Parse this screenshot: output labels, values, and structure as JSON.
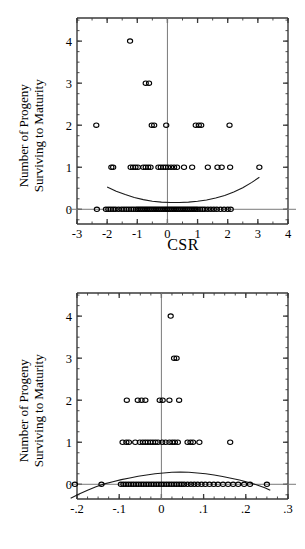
{
  "figure": {
    "panels": [
      {
        "id": "csr",
        "ylabel_line1": "Number of Progeny",
        "ylabel_line2": "Surviving to Maturity",
        "xlabel": "CSR"
      },
      {
        "id": "emr",
        "ylabel_line1": "Number of Progeny",
        "ylabel_line2": "Surviving to Maturity",
        "xlabel": "EMR"
      }
    ]
  },
  "chart_data": [
    {
      "type": "scatter",
      "id": "csr-scatter",
      "title": "",
      "xlabel": "CSR",
      "ylabel": "Number of Progeny Surviving to Maturity",
      "xlim": [
        -3,
        4
      ],
      "ylim": [
        -0.35,
        4.55
      ],
      "xticks": [
        -3,
        -2,
        -1,
        0,
        1,
        2,
        3,
        4
      ],
      "xticklabels": [
        "-3",
        "-2",
        "-1",
        "0",
        "1",
        "2",
        "3",
        "4"
      ],
      "yticks": [
        0,
        1,
        2,
        3,
        4
      ],
      "yticklabels": [
        "0",
        "1",
        "2",
        "3",
        "4"
      ],
      "xminor_step": 0.5,
      "yminor_step": 0.25,
      "grid": false,
      "legend": "none",
      "marker": "open-circle",
      "reference_lines": [
        {
          "orientation": "vertical",
          "value": 0
        },
        {
          "orientation": "horizontal",
          "value": 0
        }
      ],
      "fit_curve": {
        "shape": "u-shaped-quadratic",
        "description": "logistic/quadratic fit, minimum near x=0.3",
        "x": [
          -2.0,
          -1.7,
          -1.4,
          -1.1,
          -0.8,
          -0.5,
          -0.2,
          0.1,
          0.4,
          0.7,
          1.0,
          1.3,
          1.6,
          1.9,
          2.2,
          2.5,
          2.8,
          3.05
        ],
        "y": [
          0.53,
          0.43,
          0.35,
          0.28,
          0.23,
          0.19,
          0.17,
          0.16,
          0.16,
          0.17,
          0.19,
          0.22,
          0.27,
          0.33,
          0.41,
          0.51,
          0.64,
          0.76
        ]
      },
      "points": [
        {
          "x": -1.24,
          "y": 4
        },
        {
          "x": -0.72,
          "y": 3
        },
        {
          "x": -0.61,
          "y": 3
        },
        {
          "x": -2.36,
          "y": 2
        },
        {
          "x": -0.52,
          "y": 2
        },
        {
          "x": -0.44,
          "y": 2
        },
        {
          "x": -0.04,
          "y": 2
        },
        {
          "x": 0.94,
          "y": 2
        },
        {
          "x": 1.04,
          "y": 2
        },
        {
          "x": 1.12,
          "y": 2
        },
        {
          "x": 2.06,
          "y": 2
        },
        {
          "x": -1.86,
          "y": 1
        },
        {
          "x": -1.8,
          "y": 1
        },
        {
          "x": -1.22,
          "y": 1
        },
        {
          "x": -1.14,
          "y": 1
        },
        {
          "x": -1.06,
          "y": 1
        },
        {
          "x": -0.98,
          "y": 1
        },
        {
          "x": -0.8,
          "y": 1
        },
        {
          "x": -0.72,
          "y": 1
        },
        {
          "x": -0.64,
          "y": 1
        },
        {
          "x": -0.56,
          "y": 1
        },
        {
          "x": -0.3,
          "y": 1
        },
        {
          "x": -0.22,
          "y": 1
        },
        {
          "x": -0.14,
          "y": 1
        },
        {
          "x": -0.06,
          "y": 1
        },
        {
          "x": 0.02,
          "y": 1
        },
        {
          "x": 0.12,
          "y": 1
        },
        {
          "x": 0.22,
          "y": 1
        },
        {
          "x": 0.32,
          "y": 1
        },
        {
          "x": 0.55,
          "y": 1
        },
        {
          "x": 0.82,
          "y": 1
        },
        {
          "x": 1.34,
          "y": 1
        },
        {
          "x": 1.66,
          "y": 1
        },
        {
          "x": 1.8,
          "y": 1
        },
        {
          "x": 2.08,
          "y": 1
        },
        {
          "x": 3.05,
          "y": 1
        },
        {
          "x": -2.34,
          "y": 0
        },
        {
          "x": -2.04,
          "y": 0
        },
        {
          "x": -1.96,
          "y": 0
        },
        {
          "x": -1.88,
          "y": 0
        },
        {
          "x": -1.8,
          "y": 0
        },
        {
          "x": -1.72,
          "y": 0
        },
        {
          "x": -1.62,
          "y": 0
        },
        {
          "x": -1.52,
          "y": 0
        },
        {
          "x": -1.44,
          "y": 0
        },
        {
          "x": -1.36,
          "y": 0
        },
        {
          "x": -1.28,
          "y": 0
        },
        {
          "x": -1.2,
          "y": 0
        },
        {
          "x": -1.12,
          "y": 0
        },
        {
          "x": -1.04,
          "y": 0
        },
        {
          "x": -0.98,
          "y": 0
        },
        {
          "x": -0.92,
          "y": 0
        },
        {
          "x": -0.86,
          "y": 0
        },
        {
          "x": -0.8,
          "y": 0
        },
        {
          "x": -0.74,
          "y": 0
        },
        {
          "x": -0.68,
          "y": 0
        },
        {
          "x": -0.62,
          "y": 0
        },
        {
          "x": -0.56,
          "y": 0
        },
        {
          "x": -0.5,
          "y": 0
        },
        {
          "x": -0.44,
          "y": 0
        },
        {
          "x": -0.38,
          "y": 0
        },
        {
          "x": -0.32,
          "y": 0
        },
        {
          "x": -0.26,
          "y": 0
        },
        {
          "x": -0.2,
          "y": 0
        },
        {
          "x": -0.14,
          "y": 0
        },
        {
          "x": -0.08,
          "y": 0
        },
        {
          "x": -0.02,
          "y": 0
        },
        {
          "x": 0.04,
          "y": 0
        },
        {
          "x": 0.1,
          "y": 0
        },
        {
          "x": 0.16,
          "y": 0
        },
        {
          "x": 0.22,
          "y": 0
        },
        {
          "x": 0.28,
          "y": 0
        },
        {
          "x": 0.34,
          "y": 0
        },
        {
          "x": 0.4,
          "y": 0
        },
        {
          "x": 0.46,
          "y": 0
        },
        {
          "x": 0.52,
          "y": 0
        },
        {
          "x": 0.58,
          "y": 0
        },
        {
          "x": 0.64,
          "y": 0
        },
        {
          "x": 0.7,
          "y": 0
        },
        {
          "x": 0.76,
          "y": 0
        },
        {
          "x": 0.82,
          "y": 0
        },
        {
          "x": 0.88,
          "y": 0
        },
        {
          "x": 0.94,
          "y": 0
        },
        {
          "x": 1.0,
          "y": 0
        },
        {
          "x": 1.08,
          "y": 0
        },
        {
          "x": 1.16,
          "y": 0
        },
        {
          "x": 1.24,
          "y": 0
        },
        {
          "x": 1.34,
          "y": 0
        },
        {
          "x": 1.44,
          "y": 0
        },
        {
          "x": 1.54,
          "y": 0
        },
        {
          "x": 1.64,
          "y": 0
        },
        {
          "x": 1.76,
          "y": 0
        },
        {
          "x": 1.88,
          "y": 0
        },
        {
          "x": 2.0,
          "y": 0
        },
        {
          "x": 2.1,
          "y": 0
        }
      ]
    },
    {
      "type": "scatter",
      "id": "emr-scatter",
      "title": "",
      "xlabel": "EMR",
      "ylabel": "Number of Progeny Surviving to Maturity",
      "xlim": [
        -0.2,
        0.3
      ],
      "ylim": [
        -0.35,
        4.55
      ],
      "xticks": [
        -0.2,
        -0.1,
        0,
        0.1,
        0.2,
        0.3
      ],
      "xticklabels": [
        "-.2",
        "-.1",
        "0",
        ".1",
        ".2",
        ".3"
      ],
      "yticks": [
        0,
        1,
        2,
        3,
        4
      ],
      "yticklabels": [
        "0",
        "1",
        "2",
        "3",
        "4"
      ],
      "xminor_step": 0.025,
      "yminor_step": 0.25,
      "grid": false,
      "legend": "none",
      "marker": "open-circle",
      "reference_lines": [
        {
          "orientation": "vertical",
          "value": 0
        },
        {
          "orientation": "horizontal",
          "value": 0
        }
      ],
      "fit_curve": {
        "shape": "inverted-u-quadratic",
        "description": "logistic/quadratic fit, maximum near x=0.04",
        "x": [
          -0.215,
          -0.195,
          -0.175,
          -0.155,
          -0.135,
          -0.115,
          -0.095,
          -0.075,
          -0.055,
          -0.035,
          -0.015,
          0.005,
          0.025,
          0.045,
          0.065,
          0.085,
          0.105,
          0.125,
          0.145,
          0.165,
          0.185,
          0.205,
          0.225,
          0.245,
          0.258
        ],
        "y": [
          -0.33,
          -0.23,
          -0.14,
          -0.06,
          0.01,
          0.06,
          0.11,
          0.15,
          0.19,
          0.22,
          0.25,
          0.27,
          0.285,
          0.29,
          0.285,
          0.27,
          0.25,
          0.22,
          0.185,
          0.145,
          0.1,
          0.05,
          -0.01,
          -0.08,
          -0.14
        ]
      },
      "points": [
        {
          "x": 0.022,
          "y": 4
        },
        {
          "x": 0.03,
          "y": 3
        },
        {
          "x": 0.036,
          "y": 3
        },
        {
          "x": -0.082,
          "y": 2
        },
        {
          "x": -0.056,
          "y": 2
        },
        {
          "x": -0.047,
          "y": 2
        },
        {
          "x": -0.038,
          "y": 2
        },
        {
          "x": -0.004,
          "y": 2
        },
        {
          "x": 0.003,
          "y": 2
        },
        {
          "x": 0.019,
          "y": 2
        },
        {
          "x": 0.042,
          "y": 2
        },
        {
          "x": -0.092,
          "y": 1
        },
        {
          "x": -0.083,
          "y": 1
        },
        {
          "x": -0.077,
          "y": 1
        },
        {
          "x": -0.062,
          "y": 1
        },
        {
          "x": -0.051,
          "y": 1
        },
        {
          "x": -0.044,
          "y": 1
        },
        {
          "x": -0.038,
          "y": 1
        },
        {
          "x": -0.032,
          "y": 1
        },
        {
          "x": -0.026,
          "y": 1
        },
        {
          "x": -0.02,
          "y": 1
        },
        {
          "x": -0.014,
          "y": 1
        },
        {
          "x": -0.008,
          "y": 1
        },
        {
          "x": 0.002,
          "y": 1
        },
        {
          "x": 0.01,
          "y": 1
        },
        {
          "x": 0.019,
          "y": 1
        },
        {
          "x": 0.026,
          "y": 1
        },
        {
          "x": 0.032,
          "y": 1
        },
        {
          "x": 0.039,
          "y": 1
        },
        {
          "x": 0.062,
          "y": 1
        },
        {
          "x": 0.069,
          "y": 1
        },
        {
          "x": 0.075,
          "y": 1
        },
        {
          "x": 0.09,
          "y": 1
        },
        {
          "x": 0.163,
          "y": 1
        },
        {
          "x": -0.205,
          "y": 0
        },
        {
          "x": -0.142,
          "y": 0
        },
        {
          "x": -0.096,
          "y": 0
        },
        {
          "x": -0.09,
          "y": 0
        },
        {
          "x": -0.084,
          "y": 0
        },
        {
          "x": -0.078,
          "y": 0
        },
        {
          "x": -0.072,
          "y": 0
        },
        {
          "x": -0.066,
          "y": 0
        },
        {
          "x": -0.06,
          "y": 0
        },
        {
          "x": -0.054,
          "y": 0
        },
        {
          "x": -0.048,
          "y": 0
        },
        {
          "x": -0.042,
          "y": 0
        },
        {
          "x": -0.036,
          "y": 0
        },
        {
          "x": -0.03,
          "y": 0
        },
        {
          "x": -0.024,
          "y": 0
        },
        {
          "x": -0.018,
          "y": 0
        },
        {
          "x": -0.012,
          "y": 0
        },
        {
          "x": -0.006,
          "y": 0
        },
        {
          "x": 0.0,
          "y": 0
        },
        {
          "x": 0.006,
          "y": 0
        },
        {
          "x": 0.012,
          "y": 0
        },
        {
          "x": 0.018,
          "y": 0
        },
        {
          "x": 0.024,
          "y": 0
        },
        {
          "x": 0.03,
          "y": 0
        },
        {
          "x": 0.036,
          "y": 0
        },
        {
          "x": 0.042,
          "y": 0
        },
        {
          "x": 0.048,
          "y": 0
        },
        {
          "x": 0.054,
          "y": 0
        },
        {
          "x": 0.062,
          "y": 0
        },
        {
          "x": 0.07,
          "y": 0
        },
        {
          "x": 0.078,
          "y": 0
        },
        {
          "x": 0.086,
          "y": 0
        },
        {
          "x": 0.095,
          "y": 0
        },
        {
          "x": 0.104,
          "y": 0
        },
        {
          "x": 0.114,
          "y": 0
        },
        {
          "x": 0.124,
          "y": 0
        },
        {
          "x": 0.134,
          "y": 0
        },
        {
          "x": 0.146,
          "y": 0
        },
        {
          "x": 0.158,
          "y": 0
        },
        {
          "x": 0.17,
          "y": 0
        },
        {
          "x": 0.182,
          "y": 0
        },
        {
          "x": 0.196,
          "y": 0
        },
        {
          "x": 0.21,
          "y": 0
        },
        {
          "x": 0.25,
          "y": 0
        }
      ]
    }
  ]
}
